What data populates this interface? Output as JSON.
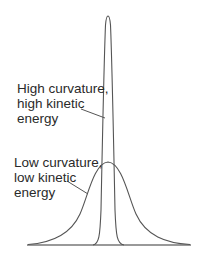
{
  "diagram": {
    "type": "wavefunction-comparison",
    "colors": {
      "curve": "#555555",
      "baseline": "#777777",
      "text": "#2a2a2a",
      "background": "#ffffff"
    },
    "curves": [
      {
        "name": "narrow-peak",
        "description": "High curvature, high kinetic energy",
        "center_x": 108,
        "peak_y": 15,
        "base_half_width": 15
      },
      {
        "name": "wide-peak",
        "description": "Low curvature, low kinetic energy",
        "center_x": 108,
        "peak_y": 162,
        "base_half_width": 80
      }
    ],
    "labels": {
      "high": {
        "lines": [
          "High curvature,",
          "high kinetic",
          "energy"
        ]
      },
      "low": {
        "lines": [
          "Low curvature,",
          "low kinetic",
          "energy"
        ]
      }
    }
  }
}
